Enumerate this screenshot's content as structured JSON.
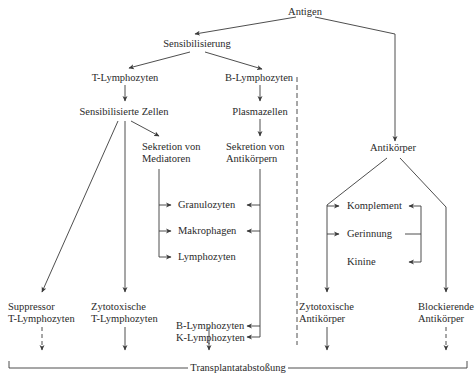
{
  "diagram": {
    "nodes": {
      "antigen": "Antigen",
      "sensibilisierung": "Sensibilisierung",
      "t_lymphozyten": "T-Lymphozyten",
      "b_lymphozyten": "B-Lymphozyten",
      "sensibilisierte_zellen": "Sensibilisierte Zellen",
      "plasmazellen": "Plasmazellen",
      "sekretion_mediatoren_1": "Sekretion von",
      "sekretion_mediatoren_2": "Mediatoren",
      "sekretion_antikoerpern_1": "Sekretion von",
      "sekretion_antikoerpern_2": "Antikörpern",
      "antikoerper": "Antikörper",
      "granulozyten": "Granulozyten",
      "makrophagen": "Makrophagen",
      "lymphozyten": "Lymphozyten",
      "komplement": "Komplement",
      "gerinnung": "Gerinnung",
      "kinine": "Kinine",
      "suppressor_1": "Suppressor",
      "suppressor_2": "T-Lymphozyten",
      "zytotox_t_1": "Zytotoxische",
      "zytotox_t_2": "T-Lymphozyten",
      "bk_1": "B-Lymphozyten",
      "bk_2": "K-Lymphozyten",
      "zytotox_ak_1": "Zytotoxische",
      "zytotox_ak_2": "Antikörper",
      "blockierend_1": "Blockierende",
      "blockierend_2": "Antikörper",
      "transplantatabstossung": "Transplantatabstoßung"
    },
    "colors": {
      "line": "#3a3a3a",
      "text": "#2a2a2a",
      "background": "#ffffff"
    }
  }
}
